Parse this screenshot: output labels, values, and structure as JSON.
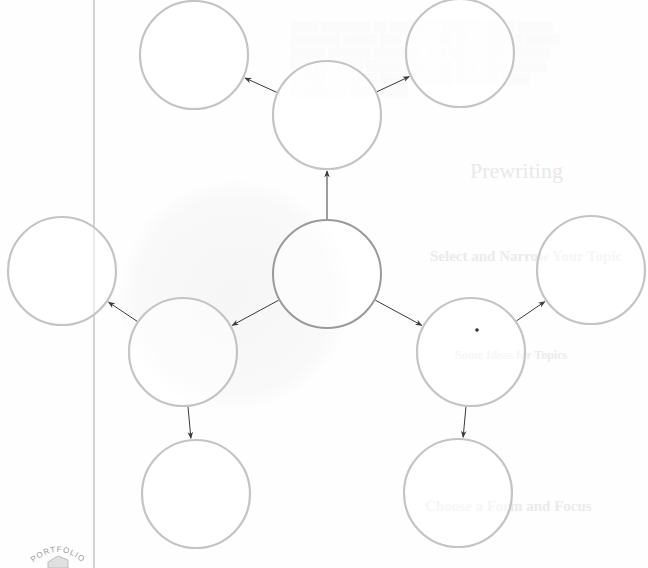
{
  "diagram": {
    "type": "cluster-web",
    "canvas": {
      "width": 648,
      "height": 568
    },
    "colors": {
      "background": "#fefefe",
      "node_stroke": "#c4c4c4",
      "center_node_stroke": "#9a9a9a",
      "arrow": "#3a3a3a",
      "margin_line": "#a8a8a8",
      "dot": "#333333"
    },
    "margin_line": {
      "x": 94,
      "y1": 0,
      "y2": 568
    },
    "nodes": [
      {
        "id": "center",
        "label": "",
        "cx": 327,
        "cy": 274,
        "r": 54,
        "center": true
      },
      {
        "id": "top",
        "label": "",
        "cx": 327,
        "cy": 115,
        "r": 54
      },
      {
        "id": "top-left",
        "label": "",
        "cx": 194,
        "cy": 55,
        "r": 54
      },
      {
        "id": "top-right",
        "label": "",
        "cx": 460,
        "cy": 53,
        "r": 54
      },
      {
        "id": "left",
        "label": "",
        "cx": 62,
        "cy": 271,
        "r": 54
      },
      {
        "id": "lower-left",
        "label": "",
        "cx": 183,
        "cy": 352,
        "r": 54
      },
      {
        "id": "bottom-left",
        "label": "",
        "cx": 196,
        "cy": 494,
        "r": 54
      },
      {
        "id": "right",
        "label": "",
        "cx": 591,
        "cy": 270,
        "r": 54
      },
      {
        "id": "lower-right",
        "label": "",
        "cx": 471,
        "cy": 352,
        "r": 54
      },
      {
        "id": "bottom-right",
        "label": "",
        "cx": 458,
        "cy": 493,
        "r": 54
      }
    ],
    "edges": [
      {
        "from": "center",
        "to": "top"
      },
      {
        "from": "top",
        "to": "top-left"
      },
      {
        "from": "top",
        "to": "top-right"
      },
      {
        "from": "center",
        "to": "lower-left"
      },
      {
        "from": "lower-left",
        "to": "left"
      },
      {
        "from": "lower-left",
        "to": "bottom-left"
      },
      {
        "from": "center",
        "to": "lower-right"
      },
      {
        "from": "lower-right",
        "to": "right"
      },
      {
        "from": "lower-right",
        "to": "bottom-right"
      }
    ],
    "marks": [
      {
        "type": "dot",
        "x": 477,
        "y": 330,
        "r": 1.8
      }
    ]
  },
  "show_through": {
    "heading": "Prewriting",
    "subheading_1": "Select and Narrow Your Topic",
    "list_intro": "Some Ideas for Topics",
    "subheading_2": "Choose a Form and Focus",
    "badge": "PORTFOLIO"
  }
}
